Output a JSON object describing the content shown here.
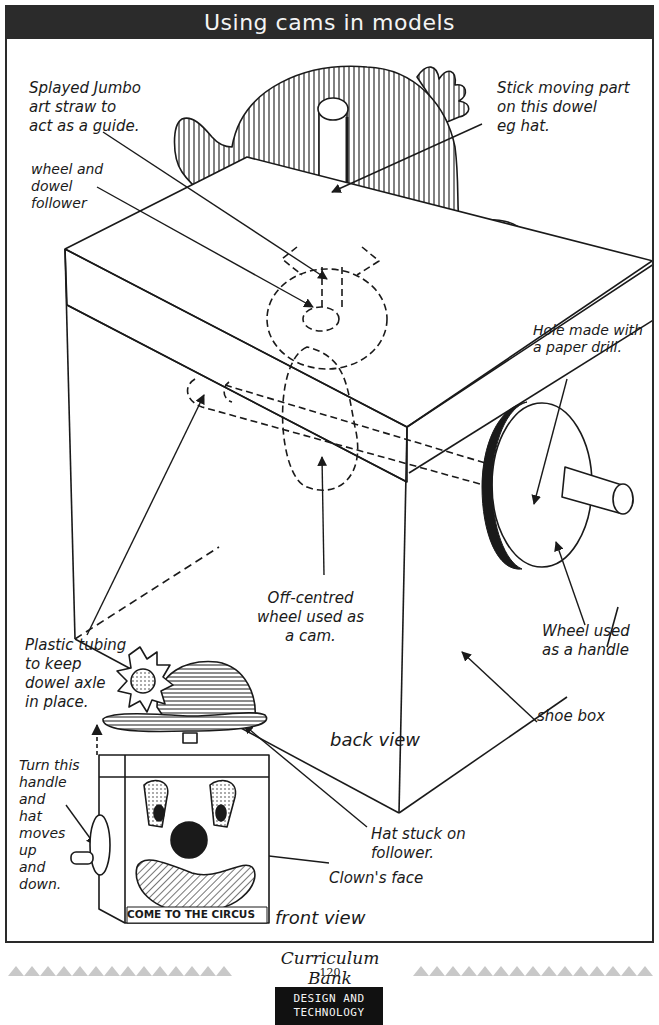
{
  "page": {
    "title": "Using cams in models",
    "views": {
      "back": "back view",
      "front": "front view"
    },
    "labels": {
      "straw_guide": "Splayed Jumbo\nart straw to\nact as a guide.",
      "wheel_follower": "wheel and\ndowel\nfollower",
      "stick_part": "Stick moving part\non this dowel\neg hat.",
      "hole_drill": "Hole made with\na paper drill.",
      "off_centred": "Off-centred\nwheel used as\na cam.",
      "plastic_tubing": "Plastic tubing\nto keep\ndowel axle\nin place.",
      "wheel_handle": "Wheel used\nas a handle",
      "shoe_box": "shoe box",
      "turn_handle": "Turn this\nhandle\nand\nhat\nmoves\nup\nand\ndown.",
      "hat_stuck": "Hat stuck on\nfollower.",
      "clowns_face": "Clown's face",
      "circus_sign": "COME TO THE CIRCUS"
    },
    "icons": {
      "hat_back": "bowler-hat-icon",
      "box": "shoe-box-icon",
      "cam": "cam-wheel-icon",
      "handle_wheel": "handle-wheel-icon",
      "clown": "clown-face-icon",
      "flower": "flower-icon"
    }
  },
  "footer": {
    "brand": "Curriculum Bank",
    "page_number": "120",
    "subject": "DESIGN AND\nTECHNOLOGY"
  },
  "colors": {
    "title_bg": "#2b2b2b",
    "title_fg": "#f4f4f4",
    "ink": "#1a1a1a",
    "triangle": "#c8c8c8",
    "badge_bg": "#111111"
  }
}
